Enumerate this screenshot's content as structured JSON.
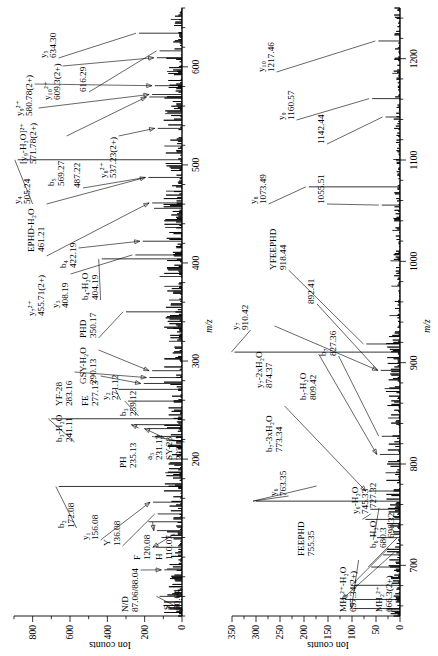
{
  "figure": {
    "type": "mass-spectrum",
    "panel_count": 2,
    "y_axis_title": "Ion counts",
    "x_axis_title": "m/z"
  },
  "chart_data": [
    {
      "type": "line",
      "id": "panel-a",
      "title": "",
      "xlabel": "m/z",
      "ylabel": "Ion counts",
      "xlim": [
        40,
        660
      ],
      "ylim": [
        0,
        900
      ],
      "xticks": [
        200,
        300,
        400,
        500,
        600
      ],
      "yticks": [
        0,
        200,
        400,
        600,
        800
      ],
      "grid": false,
      "legend": "none",
      "peaks": [
        {
          "mz": 60.04,
          "intensity": 120,
          "label": "S",
          "value": "60.04"
        },
        {
          "mz": 70.07,
          "intensity": 60,
          "label": "",
          "value": ""
        },
        {
          "mz": 87.06,
          "intensity": 95,
          "label": "N/D",
          "value": "87.06/88.04"
        },
        {
          "mz": 88.04,
          "intensity": 80,
          "label": "",
          "value": ""
        },
        {
          "mz": 110.07,
          "intensity": 140,
          "label": "H",
          "value": "110.07"
        },
        {
          "mz": 120.08,
          "intensity": 110,
          "label": "F",
          "value": "120.08"
        },
        {
          "mz": 127.05,
          "intensity": 135,
          "label": "",
          "value": "127.05"
        },
        {
          "mz": 136.08,
          "intensity": 180,
          "label": "Y",
          "value": "136.08"
        },
        {
          "mz": 144.08,
          "intensity": 130,
          "label": "",
          "value": "144.08"
        },
        {
          "mz": 156.08,
          "intensity": 155,
          "label": "y1",
          "value": "156.08"
        },
        {
          "mz": 172.08,
          "intensity": 660,
          "label": "b2",
          "value": "172.08"
        },
        {
          "mz": 186.09,
          "intensity": 90,
          "label": "",
          "value": ""
        },
        {
          "mz": 200.1,
          "intensity": 70,
          "label": "",
          "value": ""
        },
        {
          "mz": 223.11,
          "intensity": 145,
          "label": "SY-28",
          "value": "223.11"
        },
        {
          "mz": 231.12,
          "intensity": 185,
          "label": "a3",
          "value": "231.12"
        },
        {
          "mz": 235.13,
          "intensity": 255,
          "label": "PH",
          "value": "235.13"
        },
        {
          "mz": 241.11,
          "intensity": 700,
          "label": "b3-H2O",
          "value": "241.11"
        },
        {
          "mz": 259.12,
          "intensity": 290,
          "label": "b3",
          "value": "259.12"
        },
        {
          "mz": 271.12,
          "intensity": 340,
          "label": "y2",
          "value": "271.12"
        },
        {
          "mz": 277.13,
          "intensity": 205,
          "label": "FE",
          "value": "277.13"
        },
        {
          "mz": 283.16,
          "intensity": 175,
          "label": "YF-28",
          "value": "283.16"
        },
        {
          "mz": 290.13,
          "intensity": 160,
          "label": "GSY-H2O",
          "value": "290.13"
        },
        {
          "mz": 302.14,
          "intensity": 95,
          "label": "",
          "value": ""
        },
        {
          "mz": 320.15,
          "intensity": 70,
          "label": "",
          "value": ""
        },
        {
          "mz": 333.16,
          "intensity": 80,
          "label": "",
          "value": ""
        },
        {
          "mz": 350.17,
          "intensity": 300,
          "label": "PHD",
          "value": "350.17"
        },
        {
          "mz": 362.17,
          "intensity": 70,
          "label": "",
          "value": ""
        },
        {
          "mz": 376.18,
          "intensity": 95,
          "label": "",
          "value": ""
        },
        {
          "mz": 386.18,
          "intensity": 120,
          "label": "",
          "value": ""
        },
        {
          "mz": 404.19,
          "intensity": 430,
          "label": "b4-H2O",
          "value": "404.19"
        },
        {
          "mz": 408.19,
          "intensity": 250,
          "label": "y3",
          "value": "408.19"
        },
        {
          "mz": 422.19,
          "intensity": 210,
          "label": "b4",
          "value": "422.19"
        },
        {
          "mz": 436.2,
          "intensity": 90,
          "label": "",
          "value": ""
        },
        {
          "mz": 455.71,
          "intensity": 150,
          "label": "y7(2+)",
          "value": "455.71(2+)"
        },
        {
          "mz": 461.21,
          "intensity": 160,
          "label": "EPHD-H2O",
          "value": "461.21"
        },
        {
          "mz": 473.22,
          "intensity": 85,
          "label": "",
          "value": ""
        },
        {
          "mz": 487.22,
          "intensity": 180,
          "label": "",
          "value": "487.22"
        },
        {
          "mz": 505.24,
          "intensity": 880,
          "label": "y4",
          "value": "505.24"
        },
        {
          "mz": 519.24,
          "intensity": 95,
          "label": "",
          "value": ""
        },
        {
          "mz": 537.23,
          "intensity": 130,
          "label": "y8(2+)",
          "value": "537.23(2+)"
        },
        {
          "mz": 552.25,
          "intensity": 90,
          "label": "",
          "value": ""
        },
        {
          "mz": 569.27,
          "intensity": 175,
          "label": "b5",
          "value": "569.27"
        },
        {
          "mz": 571.78,
          "intensity": 160,
          "label": "[y9-H2O](2+)",
          "value": "571.78(2+)"
        },
        {
          "mz": 580.78,
          "intensity": 145,
          "label": "y9(2+)",
          "value": "580.78(2+)"
        },
        {
          "mz": 595.28,
          "intensity": 80,
          "label": "",
          "value": ""
        },
        {
          "mz": 609.3,
          "intensity": 135,
          "label": "y10(2+)",
          "value": "609.3(2+)"
        },
        {
          "mz": 616.29,
          "intensity": 120,
          "label": "",
          "value": "616.29"
        },
        {
          "mz": 634.3,
          "intensity": 230,
          "label": "y5",
          "value": "634.30"
        },
        {
          "mz": 648.31,
          "intensity": 60,
          "label": "",
          "value": ""
        }
      ]
    },
    {
      "type": "line",
      "id": "panel-b",
      "title": "",
      "xlabel": "m/z",
      "ylabel": "Ion counts",
      "xlim": [
        650,
        1250
      ],
      "ylim": [
        0,
        350
      ],
      "xticks": [
        700,
        800,
        900,
        1000,
        1100,
        1200
      ],
      "yticks": [
        0,
        50,
        100,
        150,
        200,
        250,
        300,
        350
      ],
      "grid": false,
      "legend": "none",
      "peaks": [
        {
          "mz": 657.34,
          "intensity": 95,
          "label": "MH2(2+)-H2O",
          "value": "657.34(2+)"
        },
        {
          "mz": 666.3,
          "intensity": 115,
          "label": "MH2(2+)",
          "value": "666.3(2+)"
        },
        {
          "mz": 680.3,
          "intensity": 95,
          "label": "b6-H2O",
          "value": "680.3"
        },
        {
          "mz": 698.32,
          "intensity": 60,
          "label": "",
          "value": "698.32"
        },
        {
          "mz": 710.33,
          "intensity": 35,
          "label": "",
          "value": ""
        },
        {
          "mz": 727.32,
          "intensity": 48,
          "label": "",
          "value": "727.32"
        },
        {
          "mz": 745.33,
          "intensity": 72,
          "label": "y6-H2O",
          "value": "745.33"
        },
        {
          "mz": 755.35,
          "intensity": 62,
          "label": "FEEPHD",
          "value": "755.35"
        },
        {
          "mz": 763.35,
          "intensity": 300,
          "label": "y6",
          "value": "763.35"
        },
        {
          "mz": 773.34,
          "intensity": 65,
          "label": "b7-3xH2O",
          "value": "773.34"
        },
        {
          "mz": 791.35,
          "intensity": 30,
          "label": "",
          "value": ""
        },
        {
          "mz": 809.42,
          "intensity": 42,
          "label": "b7-H2O",
          "value": "809.42"
        },
        {
          "mz": 827.36,
          "intensity": 38,
          "label": "b7",
          "value": "827.36"
        },
        {
          "mz": 845.38,
          "intensity": 25,
          "label": "",
          "value": ""
        },
        {
          "mz": 874.37,
          "intensity": 32,
          "label": "y7-2xH2O",
          "value": "874.37"
        },
        {
          "mz": 892.41,
          "intensity": 40,
          "label": "",
          "value": "892.41"
        },
        {
          "mz": 910.42,
          "intensity": 345,
          "label": "y7",
          "value": "910.42"
        },
        {
          "mz": 918.44,
          "intensity": 70,
          "label": "YFEEPHD",
          "value": "918.44"
        },
        {
          "mz": 946.45,
          "intensity": 22,
          "label": "",
          "value": ""
        },
        {
          "mz": 975.46,
          "intensity": 18,
          "label": "",
          "value": ""
        },
        {
          "mz": 1000.47,
          "intensity": 20,
          "label": "",
          "value": ""
        },
        {
          "mz": 1030.48,
          "intensity": 16,
          "label": "",
          "value": ""
        },
        {
          "mz": 1055.51,
          "intensity": 38,
          "label": "",
          "value": "1055.51"
        },
        {
          "mz": 1073.49,
          "intensity": 190,
          "label": "y8",
          "value": "1073.49"
        },
        {
          "mz": 1100.5,
          "intensity": 14,
          "label": "",
          "value": ""
        },
        {
          "mz": 1142.44,
          "intensity": 30,
          "label": "",
          "value": "1142.44"
        },
        {
          "mz": 1160.57,
          "intensity": 58,
          "label": "y9",
          "value": "1160.57"
        },
        {
          "mz": 1185.5,
          "intensity": 16,
          "label": "",
          "value": ""
        },
        {
          "mz": 1217.46,
          "intensity": 45,
          "label": "y10",
          "value": "1217.46"
        }
      ]
    }
  ],
  "panel_a": {
    "axis": {
      "x_title": "m/z",
      "y_title": "Ion counts",
      "x_ticks": [
        "200",
        "300",
        "400",
        "500",
        "600"
      ],
      "y_ticks": [
        "0",
        "200",
        "400",
        "600",
        "800"
      ]
    },
    "annotations": [
      {
        "id": "a-s",
        "name": "S",
        "mz": "60.04"
      },
      {
        "id": "a-nd",
        "name": "N/D",
        "mz": "87.06/88.04"
      },
      {
        "id": "a-h",
        "name": "H",
        "mz": "110.07"
      },
      {
        "id": "a-f",
        "name": "F",
        "mz": "120.08"
      },
      {
        "id": "a-127",
        "name": "",
        "mz": "127.05"
      },
      {
        "id": "a-y",
        "name": "Y",
        "mz": "136.08"
      },
      {
        "id": "a-144",
        "name": "",
        "mz": "144.08"
      },
      {
        "id": "a-y1",
        "name": "y₁",
        "mz": "156.08"
      },
      {
        "id": "a-b2",
        "name": "b₂",
        "mz": "172.08"
      },
      {
        "id": "a-sy28",
        "name": "SY-28",
        "mz": "223.11"
      },
      {
        "id": "a-a3",
        "name": "a₃",
        "mz": "231.12"
      },
      {
        "id": "a-ph",
        "name": "PH",
        "mz": "235.13"
      },
      {
        "id": "a-b3w",
        "name": "b₃-H₂O",
        "mz": "241.11"
      },
      {
        "id": "a-b3",
        "name": "b₃",
        "mz": "259.12"
      },
      {
        "id": "a-y2",
        "name": "y₂",
        "mz": "271.12"
      },
      {
        "id": "a-fe",
        "name": "FE",
        "mz": "277.13"
      },
      {
        "id": "a-yf28",
        "name": "YF-28",
        "mz": "283.16"
      },
      {
        "id": "a-gsy",
        "name": "GSY-H₂O",
        "mz": "290.13"
      },
      {
        "id": "a-phd",
        "name": "PHD",
        "mz": "350.17"
      },
      {
        "id": "a-b4w",
        "name": "b₄-H₂O",
        "mz": "404.19"
      },
      {
        "id": "a-y3",
        "name": "y₃",
        "mz": "408.19"
      },
      {
        "id": "a-b4",
        "name": "b₄",
        "mz": "422.19"
      },
      {
        "id": "a-y7_2",
        "name": "y₇²⁺",
        "mz": "455.71(2+)"
      },
      {
        "id": "a-ephd",
        "name": "EPHD-H₂O",
        "mz": "461.21"
      },
      {
        "id": "a-487",
        "name": "",
        "mz": "487.22"
      },
      {
        "id": "a-y4",
        "name": "y₄",
        "mz": "505.24"
      },
      {
        "id": "a-y8_2",
        "name": "y₈²⁺",
        "mz": "537.23(2+)"
      },
      {
        "id": "a-b5",
        "name": "b₅",
        "mz": "569.27"
      },
      {
        "id": "a-y9w_2",
        "name": "[y₉-H₂O]²⁺",
        "mz": "571.78(2+)"
      },
      {
        "id": "a-y9_2",
        "name": "y₉²⁺",
        "mz": "580.78(2+)"
      },
      {
        "id": "a-y10_2",
        "name": "y₁₀²⁺",
        "mz": "609.3(2+)"
      },
      {
        "id": "a-616",
        "name": "",
        "mz": "616.29"
      },
      {
        "id": "a-y5",
        "name": "y₅",
        "mz": "634.30"
      }
    ]
  },
  "panel_b": {
    "axis": {
      "x_title": "m/z",
      "y_title": "Ion counts",
      "x_ticks": [
        "700",
        "800",
        "900",
        "1000",
        "1100",
        "1200"
      ],
      "y_ticks": [
        "0",
        "50",
        "100",
        "150",
        "200",
        "250",
        "300",
        "350"
      ]
    },
    "annotations": [
      {
        "id": "b-mh2w",
        "name": "MH₂²⁺-H₂O",
        "mz": "657.34(2+)"
      },
      {
        "id": "b-mh2",
        "name": "MH₂²⁺",
        "mz": "666.3(2+)"
      },
      {
        "id": "b-b6w",
        "name": "b₆-H₂O",
        "mz": "680.3"
      },
      {
        "id": "b-698",
        "name": "",
        "mz": "698.32"
      },
      {
        "id": "b-727",
        "name": "",
        "mz": "727.32"
      },
      {
        "id": "b-y6w",
        "name": "y₆-H₂O",
        "mz": "745.33"
      },
      {
        "id": "b-feephd",
        "name": "FEEPHD",
        "mz": "755.35"
      },
      {
        "id": "b-y6",
        "name": "y₆",
        "mz": "763.35"
      },
      {
        "id": "b-b73w",
        "name": "b₇-3xH₂O",
        "mz": "773.34"
      },
      {
        "id": "b-b7w",
        "name": "b₇-H₂O",
        "mz": "809.42"
      },
      {
        "id": "b-b7",
        "name": "b₇",
        "mz": "827.36"
      },
      {
        "id": "b-y72w",
        "name": "y₇-2xH₂O",
        "mz": "874.37"
      },
      {
        "id": "b-892",
        "name": "",
        "mz": "892.41"
      },
      {
        "id": "b-y7",
        "name": "y₇",
        "mz": "910.42"
      },
      {
        "id": "b-yfeephd",
        "name": "YFEEPHD",
        "mz": "918.44"
      },
      {
        "id": "b-1055",
        "name": "",
        "mz": "1055.51"
      },
      {
        "id": "b-y8",
        "name": "y₈",
        "mz": "1073.49"
      },
      {
        "id": "b-1142",
        "name": "",
        "mz": "1142.44"
      },
      {
        "id": "b-y9",
        "name": "y₉",
        "mz": "1160.57"
      },
      {
        "id": "b-y10",
        "name": "y₁₀",
        "mz": "1217.46"
      }
    ]
  }
}
